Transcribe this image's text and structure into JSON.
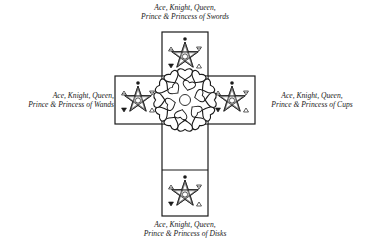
{
  "diagram": {
    "type": "tarot-cross-layout",
    "center_symbol": "rose",
    "arms": [
      {
        "position": "top",
        "suit": "Swords",
        "line1": "Ace, Knight, Queen,",
        "line2": "Prince & Princess of Swords",
        "symbol": "pentagram"
      },
      {
        "position": "left",
        "suit": "Wands",
        "line1": "Ace, Knight, Queen,",
        "line2": "Prince & Princess of Wands",
        "symbol": "pentagram"
      },
      {
        "position": "right",
        "suit": "Cups",
        "line1": "Ace, Knight, Queen,",
        "line2": "Prince & Princess of Cups",
        "symbol": "pentagram"
      },
      {
        "position": "bottom",
        "suit": "Disks",
        "line1": "Ace, Knight, Queen,",
        "line2": "Prince & Princess of Disks",
        "symbol": "pentagram"
      }
    ],
    "colors": {
      "line": "#1a1a1a",
      "background": "#ffffff"
    }
  }
}
